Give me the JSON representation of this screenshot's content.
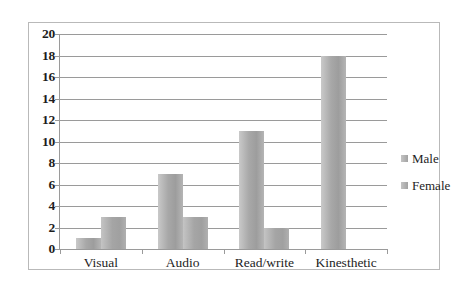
{
  "chart_data": {
    "type": "bar",
    "title": "",
    "xlabel": "",
    "ylabel": "",
    "categories": [
      "Visual",
      "Audio",
      "Read/write",
      "Kinesthetic"
    ],
    "series": [
      {
        "name": "Male",
        "values": [
          1,
          7,
          11,
          18
        ]
      },
      {
        "name": "Female",
        "values": [
          3,
          3,
          2,
          0
        ]
      }
    ],
    "ylim": [
      0,
      20
    ],
    "ytick_step": 2,
    "yticks": [
      0,
      2,
      4,
      6,
      8,
      10,
      12,
      14,
      16,
      18,
      20
    ],
    "grid": true,
    "legend_position": "right",
    "colors": {
      "male": "#a8a8a8",
      "female": "#a5a5a5",
      "gridline": "#9a9a9a",
      "axis": "#9a9a9a",
      "border": "#b9b9b9",
      "background": "#ffffff",
      "text": "#1d1d1d"
    }
  }
}
